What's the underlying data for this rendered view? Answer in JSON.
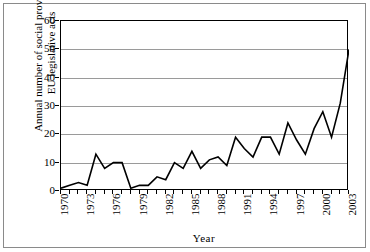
{
  "chart_data": {
    "type": "line",
    "title": "",
    "xlabel": "Year",
    "ylabel_line1": "Annual number of social provisions",
    "ylabel_line2": "EU legislative acts",
    "ylim": [
      0,
      60
    ],
    "yticks": [
      0,
      10,
      20,
      30,
      40,
      50,
      60
    ],
    "grid": true,
    "legend": "none",
    "line_color": "#000000",
    "gridline_color": "#9a9a9a",
    "axis_color": "#000000",
    "background_color": "#ffffff",
    "x": [
      1970,
      1971,
      1972,
      1973,
      1974,
      1975,
      1976,
      1977,
      1978,
      1979,
      1980,
      1981,
      1982,
      1983,
      1984,
      1985,
      1986,
      1987,
      1988,
      1989,
      1990,
      1991,
      1992,
      1993,
      1994,
      1995,
      1996,
      1997,
      1998,
      1999,
      2000,
      2001,
      2002,
      2003
    ],
    "values": [
      1,
      2,
      3,
      2,
      13,
      8,
      10,
      10,
      1,
      2,
      2,
      5,
      4,
      10,
      8,
      14,
      8,
      11,
      12,
      9,
      19,
      15,
      12,
      19,
      19,
      13,
      24,
      18,
      13,
      22,
      28,
      19,
      31,
      50
    ],
    "xtick_labels": [
      "1970",
      "1973",
      "1976",
      "1979",
      "1982",
      "1985",
      "1988",
      "1991",
      "1994",
      "1997",
      "2000",
      "2003"
    ],
    "xtick_label_years": [
      1970,
      1973,
      1976,
      1979,
      1982,
      1985,
      1988,
      1991,
      1994,
      1997,
      2000,
      2003
    ],
    "xtick_all_years": [
      1970,
      1971,
      1972,
      1973,
      1974,
      1975,
      1976,
      1977,
      1978,
      1979,
      1980,
      1981,
      1982,
      1983,
      1984,
      1985,
      1986,
      1987,
      1988,
      1989,
      1990,
      1991,
      1992,
      1993,
      1994,
      1995,
      1996,
      1997,
      1998,
      1999,
      2000,
      2001,
      2002,
      2003
    ]
  }
}
